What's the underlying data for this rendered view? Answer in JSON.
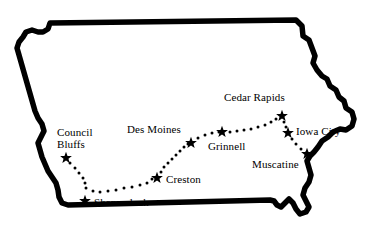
{
  "map": {
    "title": "Iowa state outline map with route",
    "state": "Iowa",
    "outline_color": "#000000",
    "background_color": "#ffffff",
    "route_style": "dotted",
    "route_color": "#000000",
    "marker_icon": "star-icon",
    "cities": [
      {
        "name": "Council\nBluffs",
        "label_x": 57,
        "label_y": 126,
        "star_x": 66,
        "star_y": 158,
        "align": "left"
      },
      {
        "name": "Des Moines",
        "label_x": 127,
        "label_y": 123,
        "star_x": 191,
        "star_y": 143,
        "align": "left"
      },
      {
        "name": "Grinnell",
        "label_x": 208,
        "label_y": 140,
        "star_x": 222,
        "star_y": 132,
        "align": "left"
      },
      {
        "name": "Cedar Rapids",
        "label_x": 224,
        "label_y": 91,
        "star_x": 282,
        "star_y": 116,
        "align": "left"
      },
      {
        "name": "Iowa City",
        "label_x": 296,
        "label_y": 125,
        "star_x": 288,
        "star_y": 133,
        "align": "left"
      },
      {
        "name": "Muscatine",
        "label_x": 252,
        "label_y": 158,
        "star_x": 307,
        "star_y": 154,
        "align": "left"
      },
      {
        "name": "Creston",
        "label_x": 166,
        "label_y": 173,
        "star_x": 157,
        "star_y": 178,
        "align": "left"
      },
      {
        "name": "Shenandoah",
        "label_x": 94,
        "label_y": 196,
        "star_x": 85,
        "star_y": 201,
        "align": "left"
      }
    ],
    "route_points": [
      [
        70,
        163
      ],
      [
        75,
        168
      ],
      [
        79,
        173
      ],
      [
        83,
        178
      ],
      [
        85,
        183
      ],
      [
        86,
        188
      ],
      [
        93,
        191
      ],
      [
        100,
        192
      ],
      [
        108,
        191
      ],
      [
        116,
        190
      ],
      [
        124,
        188
      ],
      [
        132,
        187
      ],
      [
        140,
        185
      ],
      [
        147,
        183
      ],
      [
        152,
        179
      ],
      [
        157,
        178
      ],
      [
        161,
        172
      ],
      [
        164,
        167
      ],
      [
        168,
        163
      ],
      [
        172,
        159
      ],
      [
        176,
        155
      ],
      [
        180,
        151
      ],
      [
        184,
        147
      ],
      [
        188,
        144
      ],
      [
        191,
        143
      ],
      [
        198,
        138
      ],
      [
        205,
        135
      ],
      [
        212,
        133
      ],
      [
        219,
        132
      ],
      [
        222,
        132
      ],
      [
        230,
        132
      ],
      [
        237,
        131
      ],
      [
        244,
        130
      ],
      [
        251,
        129
      ],
      [
        258,
        127
      ],
      [
        265,
        125
      ],
      [
        271,
        122
      ],
      [
        276,
        119
      ],
      [
        282,
        116
      ],
      [
        284,
        122
      ],
      [
        286,
        127
      ],
      [
        288,
        132
      ],
      [
        288,
        133
      ],
      [
        292,
        139
      ],
      [
        296,
        144
      ],
      [
        301,
        149
      ],
      [
        306,
        153
      ],
      [
        307,
        154
      ]
    ],
    "state_outline_path": "M 48,29 L 50,23 L 296,20 L 302,26 L 303,36 L 309,40 L 312,48 L 315,56 L 313,63 L 317,70 L 322,76 L 327,79 L 330,86 L 336,90 L 339,97 L 344,101 L 346,108 L 352,112 L 354,119 L 352,126 L 346,130 L 340,129 L 333,132 L 328,137 L 322,141 L 318,147 L 314,152 L 310,156 L 307,161 L 309,168 L 311,175 L 309,182 L 305,188 L 303,195 L 306,201 L 309,207 L 306,212 L 300,214 L 296,209 L 293,203 L 289,199 L 285,203 L 281,207 L 277,205 L 274,201 L 270,200 L 68,205 L 62,203 L 59,197 L 58,190 L 56,183 L 52,177 L 48,171 L 45,164 L 42,157 L 40,150 L 38,143 L 41,137 L 44,131 L 42,124 L 38,118 L 35,111 L 33,104 L 31,97 L 29,90 L 27,83 L 25,76 L 23,69 L 21,62 L 19,55 L 17,48 L 19,42 L 23,37 L 26,32 L 32,30 L 38,32 L 43,32 Z"
  }
}
